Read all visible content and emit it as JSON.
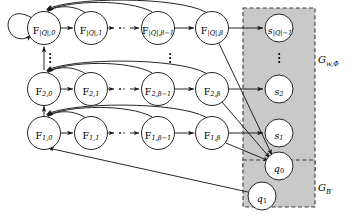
{
  "figure": {
    "type": "state-transition-diagram",
    "background": "#ffffff",
    "stroke_color": "#1a1a1a",
    "shaded_region_color": "#c9c9c9",
    "node_fill": "#ffffff",
    "dash_color": "#4a4a4a"
  },
  "groups": [
    {
      "id": "gw",
      "label_base": "G",
      "label_sub": "w,Φ",
      "label_x": 318,
      "label_y": 58,
      "box": {
        "x": 243,
        "y": 8,
        "w": 72,
        "h": 163
      }
    },
    {
      "id": "gb",
      "label_base": "G",
      "label_sub": "B′",
      "label_x": 318,
      "label_y": 186,
      "box": {
        "x": 243,
        "y": 160,
        "w": 72,
        "h": 47
      }
    }
  ],
  "rows": [
    {
      "id": "row-q",
      "cy": 28,
      "nodes": [
        {
          "id": "F-Q-0",
          "cx": 44,
          "base": "F",
          "sub": "|Q|,0"
        },
        {
          "id": "F-Q-1",
          "cx": 91,
          "base": "F",
          "sub": "|Q|,1"
        },
        {
          "id": "F-Q-b1",
          "cx": 158,
          "base": "F",
          "sub": "|Q|,β−1"
        },
        {
          "id": "F-Q-b",
          "cx": 212,
          "base": "F",
          "sub": "|Q|,β"
        }
      ],
      "sink": {
        "id": "s-Q",
        "cx": 279,
        "base": "s",
        "sub": "|Q|−1"
      }
    },
    {
      "id": "row-2",
      "cy": 89,
      "nodes": [
        {
          "id": "F-2-0",
          "cx": 44,
          "base": "F",
          "sub": "2,0"
        },
        {
          "id": "F-2-1",
          "cx": 91,
          "base": "F",
          "sub": "2,1"
        },
        {
          "id": "F-2-b1",
          "cx": 158,
          "base": "F",
          "sub": "2,β−1"
        },
        {
          "id": "F-2-b",
          "cx": 212,
          "base": "F",
          "sub": "2,β"
        }
      ],
      "sink": {
        "id": "s-2",
        "cx": 279,
        "base": "s",
        "sub": "2"
      }
    },
    {
      "id": "row-1",
      "cy": 133,
      "nodes": [
        {
          "id": "F-1-0",
          "cx": 44,
          "base": "F",
          "sub": "1,0"
        },
        {
          "id": "F-1-1",
          "cx": 91,
          "base": "F",
          "sub": "1,1"
        },
        {
          "id": "F-1-b1",
          "cx": 158,
          "base": "F",
          "sub": "1,β−1"
        },
        {
          "id": "F-1-b",
          "cx": 212,
          "base": "F",
          "sub": "1,β"
        }
      ],
      "sink": {
        "id": "s-1",
        "cx": 279,
        "base": "s",
        "sub": "1"
      }
    }
  ],
  "special_nodes": [
    {
      "id": "q0",
      "cx": 279,
      "cy": 166,
      "base": "q",
      "sub": "0"
    },
    {
      "id": "q1",
      "cx": 262,
      "cy": 196,
      "base": "q",
      "sub": "1"
    }
  ],
  "ellipses": [
    {
      "id": "vdots-left",
      "x": 44,
      "y": 58,
      "count": 3
    },
    {
      "id": "vdots-mid",
      "x": 170,
      "y": 58,
      "count": 3
    },
    {
      "id": "vdots-sinks",
      "x": 279,
      "y": 58,
      "count": 3
    }
  ],
  "node_radius": 16.5,
  "sink_radius": 14
}
